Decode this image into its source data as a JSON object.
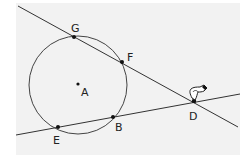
{
  "diagram": {
    "background": "#f2f2f2",
    "stroke_color": "#333333",
    "circle": {
      "center": "A",
      "cx": 78,
      "cy": 85,
      "r": 49
    },
    "points": [
      {
        "label": "G",
        "x": 74,
        "y": 37,
        "lx": 69,
        "ly": 32
      },
      {
        "label": "F",
        "x": 122,
        "y": 62,
        "lx": 128,
        "ly": 61
      },
      {
        "label": "A",
        "x": 78,
        "y": 84,
        "lx": 81,
        "ly": 96
      },
      {
        "label": "B",
        "x": 113,
        "y": 117,
        "lx": 115,
        "ly": 131
      },
      {
        "label": "E",
        "x": 58,
        "y": 127,
        "lx": 53,
        "ly": 144
      },
      {
        "label": "D",
        "x": 194,
        "y": 101,
        "lx": 188,
        "ly": 120
      }
    ],
    "lines": [
      {
        "name": "line-GFD",
        "x1": 18,
        "y1": 6,
        "x2": 238,
        "y2": 127
      },
      {
        "name": "line-EBD",
        "x1": 16,
        "y1": 135,
        "x2": 240,
        "y2": 94
      }
    ],
    "cursor": {
      "type": "pointing-hand",
      "x": 194,
      "y": 97
    }
  }
}
